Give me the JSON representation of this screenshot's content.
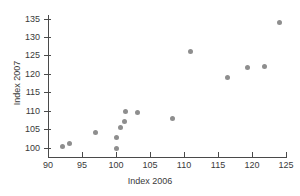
{
  "chart_data": {
    "type": "scatter",
    "title": "",
    "xlabel": "Index 2006",
    "ylabel": "Index 2007",
    "xlim": [
      90,
      125
    ],
    "ylim": [
      100,
      135
    ],
    "xticks": [
      90,
      95,
      100,
      105,
      110,
      115,
      120,
      125
    ],
    "yticks": [
      100,
      105,
      110,
      115,
      120,
      125,
      130,
      135
    ],
    "xtick_labels": [
      "90",
      "95",
      "100",
      "105",
      "110",
      "115",
      "120",
      "125"
    ],
    "ytick_labels": [
      "100",
      "105",
      "110",
      "115",
      "120",
      "125",
      "130",
      "135"
    ],
    "grid": false,
    "legend": null,
    "marker_color": "#8e8e8e",
    "axis_color": "#4a4a4a",
    "points": [
      {
        "x": 92.1,
        "y": 100.3
      },
      {
        "x": 93.2,
        "y": 101.3
      },
      {
        "x": 97.0,
        "y": 104.2
      },
      {
        "x": 100.0,
        "y": 99.8
      },
      {
        "x": 100.0,
        "y": 102.8
      },
      {
        "x": 100.7,
        "y": 105.5
      },
      {
        "x": 101.2,
        "y": 107.2
      },
      {
        "x": 101.4,
        "y": 110.0
      },
      {
        "x": 103.1,
        "y": 109.6
      },
      {
        "x": 108.3,
        "y": 108.0
      },
      {
        "x": 110.9,
        "y": 126.1
      },
      {
        "x": 116.4,
        "y": 119.0
      },
      {
        "x": 119.3,
        "y": 121.8
      },
      {
        "x": 121.8,
        "y": 122.0
      },
      {
        "x": 124.1,
        "y": 134.1
      }
    ]
  }
}
